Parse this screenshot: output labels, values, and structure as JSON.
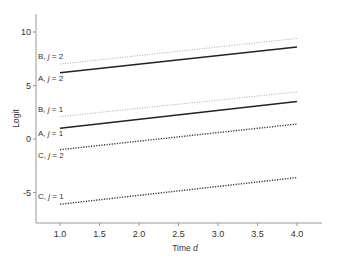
{
  "chart_data": {
    "type": "line",
    "title": "",
    "xlabel": "Time d",
    "xlabel_parts": {
      "prefix": "Time ",
      "var": "d"
    },
    "ylabel": "Logit",
    "xlim": [
      0.8,
      4.2
    ],
    "ylim": [
      -8,
      11.5
    ],
    "xticks": [
      1.0,
      1.5,
      2.0,
      2.5,
      3.0,
      3.5,
      4.0
    ],
    "xtick_labels": [
      "1.0",
      "1.5",
      "2.0",
      "2.5",
      "3.0",
      "3.5",
      "4.0"
    ],
    "yticks": [
      10,
      5,
      0,
      -5
    ],
    "ytick_labels": [
      "10",
      "5",
      "0",
      "-5"
    ],
    "grid": false,
    "legend": "none (inline labels at line starts)",
    "series": [
      {
        "name": "B, j = 2",
        "label_prefix": "B, ",
        "label_var": "j",
        "label_suffix": " = 2",
        "style": "dotted-light",
        "color": "#aaaaaa",
        "x": [
          1.0,
          4.0
        ],
        "y": [
          7.0,
          9.4
        ],
        "label_pos": "above"
      },
      {
        "name": "A, j = 2",
        "label_prefix": "A, ",
        "label_var": "j",
        "label_suffix": " = 2",
        "style": "solid",
        "color": "#222222",
        "x": [
          1.0,
          4.0
        ],
        "y": [
          6.2,
          8.6
        ],
        "label_pos": "below"
      },
      {
        "name": "B, j = 1",
        "label_prefix": "B, ",
        "label_var": "j",
        "label_suffix": " = 1",
        "style": "dotted-light",
        "color": "#aaaaaa",
        "x": [
          1.0,
          4.0
        ],
        "y": [
          2.1,
          4.4
        ],
        "label_pos": "above"
      },
      {
        "name": "A, j = 1",
        "label_prefix": "A, ",
        "label_var": "j",
        "label_suffix": " = 1",
        "style": "solid",
        "color": "#222222",
        "x": [
          1.0,
          4.0
        ],
        "y": [
          1.0,
          3.5
        ],
        "label_pos": "below"
      },
      {
        "name": "C, j = 2",
        "label_prefix": "C, ",
        "label_var": "j",
        "label_suffix": " = 2",
        "style": "dotted-dark",
        "color": "#333333",
        "x": [
          1.0,
          4.0
        ],
        "y": [
          -1.0,
          1.4
        ],
        "label_pos": "below"
      },
      {
        "name": "C, j = 1",
        "label_prefix": "C, ",
        "label_var": "j",
        "label_suffix": " = 1",
        "style": "dotted-dark",
        "color": "#333333",
        "x": [
          1.0,
          4.0
        ],
        "y": [
          -6.1,
          -3.6
        ],
        "label_pos": "above"
      }
    ]
  },
  "layout": {
    "axis_color": "#999999",
    "plot": {
      "x0_px": 36,
      "x1_px": 322,
      "y_top_px": 14,
      "y_axis_bottom_px": 223
    },
    "x_map": {
      "v1": 1.0,
      "px1": 60,
      "v2": 4.0,
      "px2": 297
    },
    "y_map": {
      "v1": 0,
      "px1": 139,
      "v2": 10,
      "px2": 32
    }
  }
}
